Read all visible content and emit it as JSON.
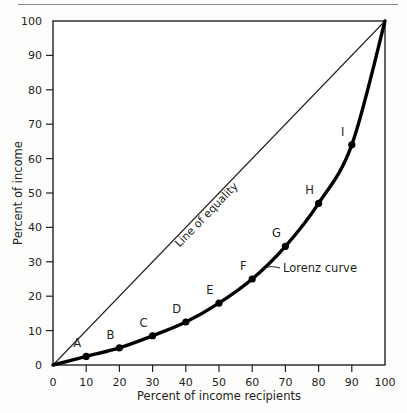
{
  "figure": {
    "name": "lorenz-curve-figure",
    "background_color": "#fdfdfc",
    "ink_color": "#231f20",
    "top_rule_color": "#8a8a8a"
  },
  "chart_data": {
    "type": "line",
    "title": "",
    "subtitle": "",
    "xlabel": "Percent of income recipients",
    "ylabel": "Percent of income",
    "xlim": [
      0,
      100
    ],
    "ylim": [
      0,
      100
    ],
    "xticks": [
      0,
      10,
      20,
      30,
      40,
      50,
      60,
      70,
      80,
      90,
      100
    ],
    "yticks": [
      0,
      10,
      20,
      30,
      40,
      50,
      60,
      70,
      80,
      90,
      100
    ],
    "xticklabels": [
      "0",
      "10",
      "20",
      "30",
      "40",
      "50",
      "60",
      "70",
      "80",
      "90",
      "100"
    ],
    "yticklabels": [
      "0",
      "10",
      "20",
      "30",
      "40",
      "50",
      "60",
      "70",
      "80",
      "90",
      "100"
    ],
    "grid": false,
    "legend": "none",
    "series": [
      {
        "name": "Line of equality",
        "style": "thin-straight",
        "x": [
          0,
          100
        ],
        "values": [
          0,
          100
        ],
        "markers": false
      },
      {
        "name": "Lorenz curve",
        "style": "thick-curve",
        "x": [
          0,
          10,
          20,
          30,
          40,
          50,
          60,
          70,
          80,
          90,
          100
        ],
        "values": [
          0,
          2.5,
          5,
          8.5,
          12.5,
          18,
          25,
          34.5,
          47,
          64,
          100
        ],
        "markers": true
      }
    ],
    "point_labels": [
      {
        "label": "A",
        "x": 10,
        "y": 2.5
      },
      {
        "label": "B",
        "x": 20,
        "y": 5
      },
      {
        "label": "C",
        "x": 30,
        "y": 8.5
      },
      {
        "label": "D",
        "x": 40,
        "y": 12.5
      },
      {
        "label": "E",
        "x": 50,
        "y": 18
      },
      {
        "label": "F",
        "x": 60,
        "y": 25
      },
      {
        "label": "G",
        "x": 70,
        "y": 34.5
      },
      {
        "label": "H",
        "x": 80,
        "y": 47
      },
      {
        "label": "I",
        "x": 90,
        "y": 64
      }
    ],
    "annotations": [
      {
        "text": "Line of equality",
        "rotated": true,
        "at_x": 47,
        "at_y": 47
      },
      {
        "text": "Lorenz curve",
        "rotated": false,
        "at_x": 68,
        "at_y": 27
      }
    ]
  },
  "axis_labels": {
    "x_title": "Percent of income recipients",
    "y_title": "Percent of income"
  },
  "annotation_text": {
    "line_of_equality": "Line of equality",
    "lorenz_curve": "Lorenz curve"
  }
}
